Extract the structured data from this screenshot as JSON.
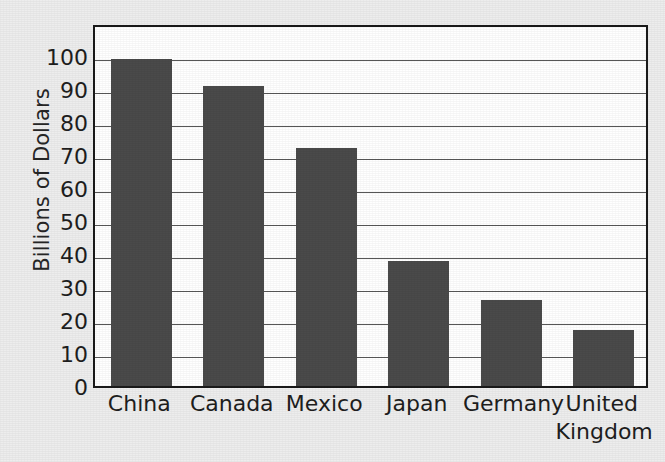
{
  "chart_data": {
    "type": "bar",
    "title": "",
    "subtitle": "",
    "xlabel": "",
    "ylabel": "Billions of Dollars",
    "categories": [
      "China",
      "Canada",
      "Mexico",
      "Japan",
      "Germany",
      "United Kingdom"
    ],
    "values": [
      99,
      91,
      72,
      38,
      26,
      17
    ],
    "ylim": [
      0,
      110
    ],
    "ytick_values": [
      0,
      10,
      20,
      30,
      40,
      50,
      60,
      70,
      80,
      90,
      100
    ],
    "ytick_labels": [
      "0",
      "10",
      "20",
      "30",
      "40",
      "50",
      "60",
      "70",
      "80",
      "90",
      "100"
    ],
    "grid": true,
    "grid_axis": "y",
    "legend": false,
    "legend_position": "none",
    "bar_color": "#4a4a4a",
    "plot_background": "#ffffff",
    "figure_background": "#ededed",
    "axis_color": "#1a1a1a",
    "gridline_color": "#575757",
    "category_label_lines": [
      [
        "China"
      ],
      [
        "Canada"
      ],
      [
        "Mexico"
      ],
      [
        "Japan"
      ],
      [
        "Germany"
      ],
      [
        "United",
        "Kingdom"
      ]
    ]
  }
}
